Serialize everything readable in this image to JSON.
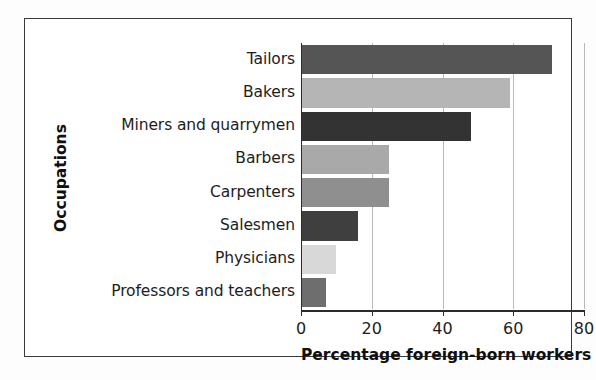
{
  "chart_data": {
    "type": "bar",
    "orientation": "horizontal",
    "title": "",
    "xlabel": "Percentage foreign-born workers",
    "ylabel": "Occupations",
    "categories": [
      "Tailors",
      "Bakers",
      "Miners and quarrymen",
      "Barbers",
      "Carpenters",
      "Salesmen",
      "Physicians",
      "Professors and teachers"
    ],
    "values": [
      71,
      59,
      48,
      25,
      25,
      16,
      10,
      7
    ],
    "xlim": [
      0,
      80
    ],
    "xticks": [
      "0",
      "20",
      "40",
      "60",
      "80"
    ],
    "xtick_values": [
      0,
      20,
      40,
      60,
      80
    ],
    "grid": "vertical",
    "legend": "none",
    "bar_colors": [
      "#555555",
      "#b5b5b5",
      "#333333",
      "#a9a9a9",
      "#8f8f8f",
      "#3f3f3f",
      "#d8d8d8",
      "#6e6e6e"
    ]
  },
  "figure": {
    "frame_color": "#3a3a3a",
    "axis_color": "#2b2b2b",
    "grid_color": "#b9b9b9",
    "background": "#ffffff"
  }
}
